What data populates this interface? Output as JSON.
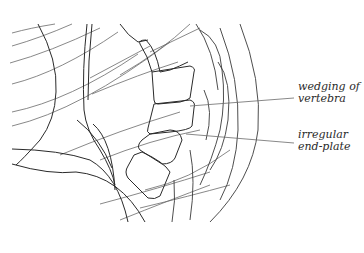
{
  "figure": {
    "line_color": "#2a2a2a",
    "thin_line_color": "#6a6a6a",
    "background": "#ffffff"
  },
  "labels": [
    {
      "id": "wedging",
      "lines": [
        "wedging of",
        "vertebra"
      ],
      "x": 298,
      "y": 81
    },
    {
      "id": "endplate",
      "lines": [
        "irregular",
        "end-plate"
      ],
      "x": 298,
      "y": 129
    }
  ]
}
